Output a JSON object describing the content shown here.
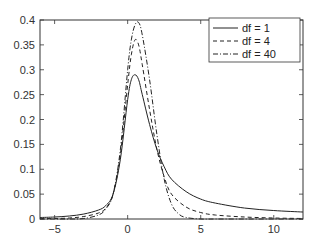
{
  "chart_data": {
    "type": "line",
    "title": "",
    "xlabel": "",
    "ylabel": "",
    "xlim": [
      -6,
      12
    ],
    "ylim": [
      0,
      0.4
    ],
    "xticks": [
      -5,
      0,
      5,
      10
    ],
    "yticks": [
      0,
      0.05,
      0.1,
      0.15,
      0.2,
      0.25,
      0.3,
      0.35,
      0.4
    ],
    "ytick_labels": [
      "0",
      "0.05",
      "0.1",
      "0.15",
      "0.2",
      "0.25",
      "0.3",
      "0.35",
      "0.4"
    ],
    "grid": false,
    "legend_position": "upper right",
    "series": [
      {
        "name": "df = 1",
        "style": "solid",
        "x": [
          -6,
          -5,
          -4,
          -3,
          -2,
          -1.5,
          -1,
          -0.5,
          0,
          0.25,
          0.5,
          0.75,
          1,
          1.5,
          2,
          2.5,
          3,
          4,
          5,
          6,
          8,
          10,
          12
        ],
        "y": [
          0.003,
          0.004,
          0.006,
          0.01,
          0.018,
          0.027,
          0.05,
          0.12,
          0.24,
          0.28,
          0.29,
          0.28,
          0.25,
          0.19,
          0.14,
          0.105,
          0.08,
          0.055,
          0.04,
          0.032,
          0.022,
          0.017,
          0.014
        ]
      },
      {
        "name": "df = 4",
        "style": "dashed",
        "x": [
          -6,
          -5,
          -4,
          -3,
          -2,
          -1.5,
          -1,
          -0.5,
          0,
          0.25,
          0.5,
          0.75,
          1,
          1.5,
          2,
          2.5,
          3,
          4,
          5,
          6,
          8,
          10,
          12
        ],
        "y": [
          0.001,
          0.001,
          0.002,
          0.005,
          0.012,
          0.022,
          0.05,
          0.13,
          0.27,
          0.33,
          0.36,
          0.35,
          0.31,
          0.22,
          0.14,
          0.085,
          0.05,
          0.024,
          0.013,
          0.008,
          0.004,
          0.002,
          0.001
        ]
      },
      {
        "name": "df = 40",
        "style": "dashdot",
        "x": [
          -6,
          -5,
          -4,
          -3,
          -2,
          -1.5,
          -1,
          -0.5,
          0,
          0.25,
          0.5,
          0.75,
          1,
          1.5,
          2,
          2.5,
          3,
          3.5,
          4,
          5,
          6,
          8,
          10,
          12
        ],
        "y": [
          0,
          0,
          0,
          0.001,
          0.008,
          0.02,
          0.05,
          0.14,
          0.3,
          0.36,
          0.39,
          0.395,
          0.37,
          0.28,
          0.17,
          0.08,
          0.03,
          0.01,
          0.003,
          0.0,
          0,
          0,
          0,
          0
        ]
      }
    ]
  },
  "legend": {
    "items": [
      {
        "label": "df = 1"
      },
      {
        "label": "df = 4"
      },
      {
        "label": "df = 40"
      }
    ]
  },
  "colors": {
    "axis": "#333333",
    "line": "#222222"
  }
}
